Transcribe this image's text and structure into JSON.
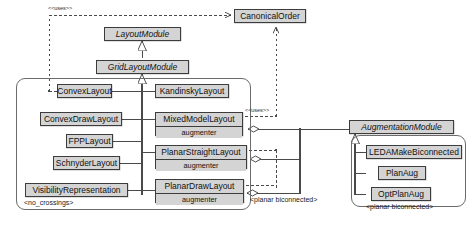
{
  "diagram": {
    "type": "uml-class-diagram",
    "legend_colors": {
      "class_fill": "#d4d4d4",
      "class_border": "#3c3c3c",
      "group_border": "#6b6b6b",
      "edge": "#4a4a4a",
      "background": "#ffffff"
    }
  },
  "nodes": {
    "canonical_order": {
      "label": "CanonicalOrder",
      "kind": "class"
    },
    "layout_module": {
      "label": "LayoutModule",
      "kind": "interface"
    },
    "grid_layout_module": {
      "label": "GridLayoutModule",
      "kind": "interface"
    },
    "convex_layout": {
      "label": "ConvexLayout",
      "kind": "class"
    },
    "convex_draw_layout": {
      "label": "ConvexDrawLayout",
      "kind": "class"
    },
    "fpp_layout": {
      "label": "FPPLayout",
      "kind": "class"
    },
    "schnyder_layout": {
      "label": "SchnyderLayout",
      "kind": "class"
    },
    "visibility_representation": {
      "label": "VisibilityRepresentation",
      "kind": "class"
    },
    "kandinsky_layout": {
      "label": "KandinskyLayout",
      "kind": "class"
    },
    "mixed_model_layout": {
      "label": "MixedModelLayout",
      "attribute": "augmenter",
      "kind": "class"
    },
    "planar_straight_layout": {
      "label": "PlanarStraightLayout",
      "attribute": "augmenter",
      "kind": "class"
    },
    "planar_draw_layout": {
      "label": "PlanarDrawLayout",
      "attribute": "augmenter",
      "kind": "class"
    },
    "augmentation_module": {
      "label": "AugmentationModule",
      "kind": "interface"
    },
    "leda_make_biconnected": {
      "label": "LEDAMakeBiconnected",
      "kind": "class"
    },
    "plan_aug": {
      "label": "PlanAug",
      "kind": "class"
    },
    "opt_plan_aug": {
      "label": "OptPlanAug",
      "kind": "class"
    }
  },
  "group_labels": {
    "no_crossings": "<no_crossings>",
    "planar_biconnected_middle": "<planar biconnected>",
    "planar_biconnected_right": "<planar biconnected>"
  },
  "edge_labels": {
    "uses_top": "<<uses>>",
    "uses_mixed_model": "<<uses>>"
  },
  "relationships": [
    {
      "from": "grid_layout_module",
      "to": "layout_module",
      "type": "generalization"
    },
    {
      "from": "convex_layout",
      "to": "grid_layout_module",
      "type": "generalization"
    },
    {
      "from": "convex_draw_layout",
      "to": "grid_layout_module",
      "type": "generalization"
    },
    {
      "from": "fpp_layout",
      "to": "grid_layout_module",
      "type": "generalization"
    },
    {
      "from": "schnyder_layout",
      "to": "grid_layout_module",
      "type": "generalization"
    },
    {
      "from": "visibility_representation",
      "to": "grid_layout_module",
      "type": "generalization"
    },
    {
      "from": "kandinsky_layout",
      "to": "grid_layout_module",
      "type": "generalization"
    },
    {
      "from": "mixed_model_layout",
      "to": "grid_layout_module",
      "type": "generalization"
    },
    {
      "from": "planar_straight_layout",
      "to": "grid_layout_module",
      "type": "generalization"
    },
    {
      "from": "planar_draw_layout",
      "to": "grid_layout_module",
      "type": "generalization"
    },
    {
      "from": "convex_layout",
      "to": "canonical_order",
      "type": "dependency",
      "label": "<<uses>>"
    },
    {
      "from": "mixed_model_layout",
      "to": "canonical_order",
      "type": "dependency",
      "label": "<<uses>>"
    },
    {
      "from": "mixed_model_layout",
      "to": "augmentation_module",
      "type": "aggregation"
    },
    {
      "from": "planar_straight_layout",
      "to": "augmentation_module",
      "type": "aggregation"
    },
    {
      "from": "planar_draw_layout",
      "to": "augmentation_module",
      "type": "aggregation"
    },
    {
      "from": "leda_make_biconnected",
      "to": "augmentation_module",
      "type": "generalization"
    },
    {
      "from": "plan_aug",
      "to": "augmentation_module",
      "type": "generalization"
    },
    {
      "from": "opt_plan_aug",
      "to": "augmentation_module",
      "type": "generalization"
    }
  ]
}
